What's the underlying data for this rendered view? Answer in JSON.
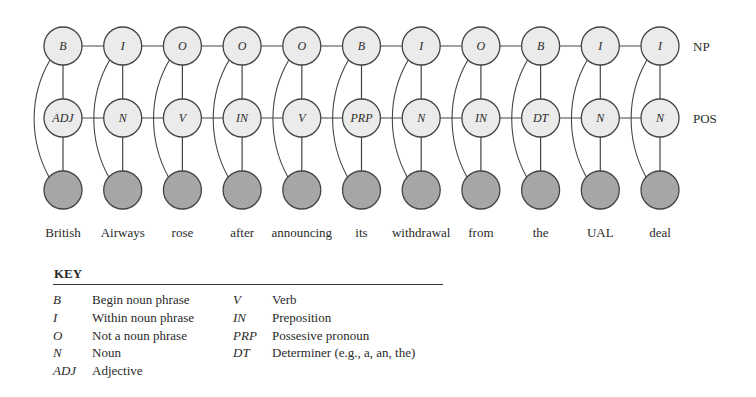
{
  "diagram": {
    "row_labels": {
      "np": "NP",
      "pos": "POS"
    },
    "columns": [
      {
        "np": "B",
        "pos": "ADJ",
        "word": "British"
      },
      {
        "np": "I",
        "pos": "N",
        "word": "Airways"
      },
      {
        "np": "O",
        "pos": "V",
        "word": "rose"
      },
      {
        "np": "O",
        "pos": "IN",
        "word": "after"
      },
      {
        "np": "O",
        "pos": "V",
        "word": "announcing"
      },
      {
        "np": "B",
        "pos": "PRP",
        "word": "its"
      },
      {
        "np": "I",
        "pos": "N",
        "word": "withdrawal"
      },
      {
        "np": "O",
        "pos": "IN",
        "word": "from"
      },
      {
        "np": "B",
        "pos": "DT",
        "word": "the"
      },
      {
        "np": "I",
        "pos": "N",
        "word": "UAL"
      },
      {
        "np": "I",
        "pos": "N",
        "word": "deal"
      }
    ],
    "colors": {
      "hidden_node_fill": "#ebebeb",
      "observed_node_fill": "#a9a9a9",
      "stroke": "#444444"
    }
  },
  "key": {
    "title": "KEY",
    "left": [
      {
        "code": "B",
        "desc": "Begin noun phrase"
      },
      {
        "code": "I",
        "desc": "Within noun phrase"
      },
      {
        "code": "O",
        "desc": "Not a noun phrase"
      },
      {
        "code": "N",
        "desc": "Noun"
      },
      {
        "code": "ADJ",
        "desc": "Adjective"
      }
    ],
    "right": [
      {
        "code": "V",
        "desc": "Verb"
      },
      {
        "code": "IN",
        "desc": "Preposition"
      },
      {
        "code": "PRP",
        "desc": "Possesive pronoun"
      },
      {
        "code": "DT",
        "desc": "Determiner (e.g., a, an, the)"
      }
    ]
  }
}
